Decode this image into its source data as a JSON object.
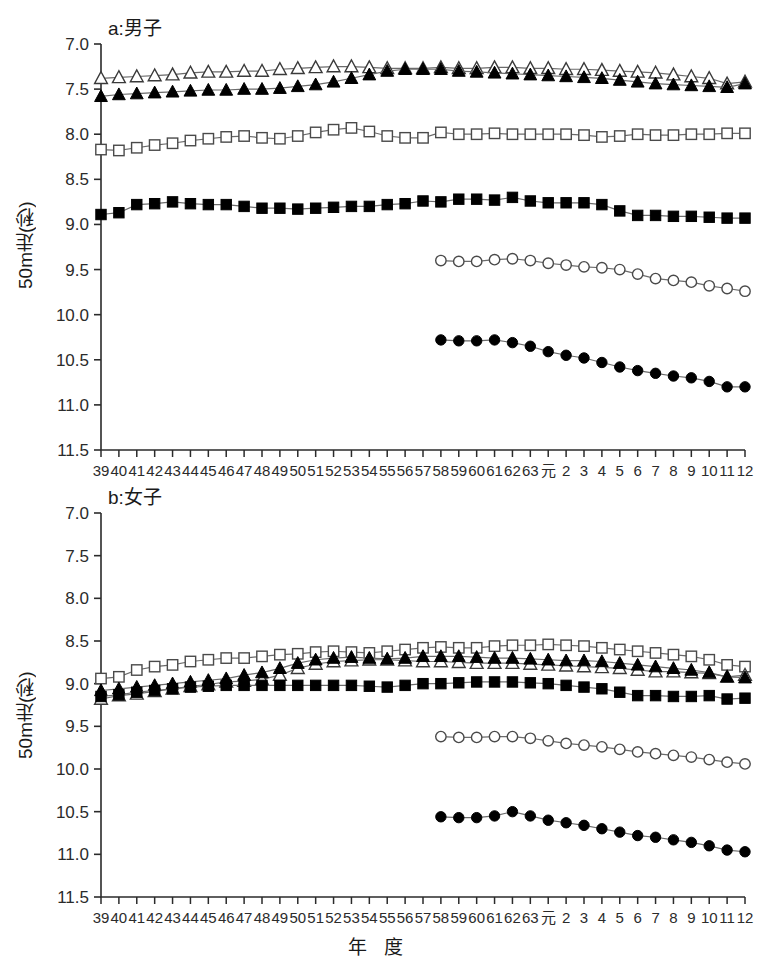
{
  "figure": {
    "width": 768,
    "height": 971,
    "xaxis_title": "年 度",
    "ylabel": "50m走(秒)"
  },
  "chart_data": [
    {
      "type": "line",
      "panel_id": "a",
      "title": "a:男子",
      "xlabel": "年 度",
      "ylabel": "50m走(秒)",
      "ylim": [
        7.0,
        11.5
      ],
      "y_inverted": true,
      "yticks": [
        "7.0",
        "7.5",
        "8.0",
        "8.5",
        "9.0",
        "9.5",
        "10.0",
        "10.5",
        "11.0",
        "11.5"
      ],
      "ytick_values": [
        7.0,
        7.5,
        8.0,
        8.5,
        9.0,
        9.5,
        10.0,
        10.5,
        11.0,
        11.5
      ],
      "grid": false,
      "legend": "none",
      "categories": [
        "39",
        "40",
        "41",
        "42",
        "43",
        "44",
        "45",
        "46",
        "47",
        "48",
        "49",
        "50",
        "51",
        "52",
        "53",
        "54",
        "55",
        "56",
        "57",
        "58",
        "59",
        "60",
        "61",
        "62",
        "63",
        "元",
        "2",
        "3",
        "4",
        "5",
        "6",
        "7",
        "8",
        "9",
        "10",
        "11",
        "12"
      ],
      "series": [
        {
          "name": "open-triangle",
          "marker": "triangle-open",
          "values": [
            7.38,
            7.37,
            7.36,
            7.35,
            7.34,
            7.32,
            7.31,
            7.31,
            7.3,
            7.3,
            7.28,
            7.27,
            7.26,
            7.25,
            7.25,
            7.26,
            7.27,
            7.27,
            7.27,
            7.26,
            7.27,
            7.27,
            7.26,
            7.26,
            7.27,
            7.27,
            7.28,
            7.28,
            7.29,
            7.3,
            7.31,
            7.32,
            7.34,
            7.36,
            7.38,
            7.44,
            7.42
          ]
        },
        {
          "name": "filled-triangle",
          "marker": "triangle-filled",
          "values": [
            7.58,
            7.56,
            7.55,
            7.54,
            7.53,
            7.52,
            7.51,
            7.51,
            7.5,
            7.5,
            7.49,
            7.47,
            7.45,
            7.42,
            7.38,
            7.34,
            7.3,
            7.28,
            7.28,
            7.28,
            7.3,
            7.31,
            7.32,
            7.33,
            7.34,
            7.35,
            7.36,
            7.37,
            7.38,
            7.4,
            7.42,
            7.44,
            7.45,
            7.46,
            7.47,
            7.48,
            7.44
          ]
        },
        {
          "name": "open-square",
          "marker": "square-open",
          "values": [
            8.17,
            8.18,
            8.15,
            8.12,
            8.1,
            8.07,
            8.05,
            8.03,
            8.02,
            8.04,
            8.05,
            8.02,
            7.98,
            7.95,
            7.93,
            7.97,
            8.02,
            8.04,
            8.04,
            7.98,
            8.0,
            8.0,
            7.99,
            8.0,
            8.0,
            8.0,
            8.0,
            8.01,
            8.03,
            8.02,
            8.0,
            8.01,
            8.01,
            8.0,
            8.0,
            7.99,
            7.99
          ]
        },
        {
          "name": "filled-square",
          "marker": "square-filled",
          "values": [
            8.89,
            8.87,
            8.78,
            8.77,
            8.75,
            8.77,
            8.78,
            8.78,
            8.8,
            8.82,
            8.82,
            8.83,
            8.82,
            8.81,
            8.8,
            8.8,
            8.78,
            8.77,
            8.74,
            8.75,
            8.72,
            8.72,
            8.73,
            8.7,
            8.74,
            8.76,
            8.76,
            8.76,
            8.78,
            8.85,
            8.9,
            8.9,
            8.91,
            8.91,
            8.92,
            8.93,
            8.93
          ]
        },
        {
          "name": "open-circle",
          "marker": "circle-open",
          "values": [
            null,
            null,
            null,
            null,
            null,
            null,
            null,
            null,
            null,
            null,
            null,
            null,
            null,
            null,
            null,
            null,
            null,
            null,
            null,
            9.4,
            9.41,
            9.41,
            9.39,
            9.38,
            9.4,
            9.43,
            9.45,
            9.47,
            9.48,
            9.5,
            9.55,
            9.6,
            9.62,
            9.64,
            9.68,
            9.71,
            9.74
          ]
        },
        {
          "name": "filled-circle",
          "marker": "circle-filled",
          "values": [
            null,
            null,
            null,
            null,
            null,
            null,
            null,
            null,
            null,
            null,
            null,
            null,
            null,
            null,
            null,
            null,
            null,
            null,
            null,
            10.28,
            10.29,
            10.29,
            10.28,
            10.31,
            10.35,
            10.41,
            10.45,
            10.48,
            10.53,
            10.58,
            10.62,
            10.65,
            10.68,
            10.7,
            10.74,
            10.8,
            10.8
          ]
        }
      ]
    },
    {
      "type": "line",
      "panel_id": "b",
      "title": "b:女子",
      "xlabel": "年 度",
      "ylabel": "50m走(秒)",
      "ylim": [
        7.0,
        11.5
      ],
      "y_inverted": true,
      "yticks": [
        "7.0",
        "7.5",
        "8.0",
        "8.5",
        "9.0",
        "9.5",
        "10.0",
        "10.5",
        "11.0",
        "11.5"
      ],
      "ytick_values": [
        7.0,
        7.5,
        8.0,
        8.5,
        9.0,
        9.5,
        10.0,
        10.5,
        11.0,
        11.5
      ],
      "grid": false,
      "legend": "none",
      "categories": [
        "39",
        "40",
        "41",
        "42",
        "43",
        "44",
        "45",
        "46",
        "47",
        "48",
        "49",
        "50",
        "51",
        "52",
        "53",
        "54",
        "55",
        "56",
        "57",
        "58",
        "59",
        "60",
        "61",
        "62",
        "63",
        "元",
        "2",
        "3",
        "4",
        "5",
        "6",
        "7",
        "8",
        "9",
        "10",
        "11",
        "12"
      ],
      "series": [
        {
          "name": "open-square",
          "marker": "square-open",
          "values": [
            8.94,
            8.92,
            8.84,
            8.8,
            8.78,
            8.74,
            8.72,
            8.7,
            8.7,
            8.68,
            8.66,
            8.65,
            8.63,
            8.62,
            8.63,
            8.64,
            8.62,
            8.6,
            8.58,
            8.57,
            8.58,
            8.58,
            8.56,
            8.55,
            8.55,
            8.54,
            8.55,
            8.56,
            8.58,
            8.6,
            8.62,
            8.64,
            8.66,
            8.68,
            8.72,
            8.78,
            8.8
          ]
        },
        {
          "name": "open-triangle",
          "marker": "triangle-open",
          "values": [
            9.18,
            9.14,
            9.12,
            9.09,
            9.06,
            9.03,
            9.01,
            8.98,
            8.97,
            8.95,
            8.9,
            8.82,
            8.77,
            8.74,
            8.73,
            8.72,
            8.72,
            8.73,
            8.74,
            8.74,
            8.75,
            8.76,
            8.76,
            8.76,
            8.77,
            8.78,
            8.79,
            8.8,
            8.81,
            8.82,
            8.84,
            8.86,
            8.86,
            8.87,
            8.88,
            8.92,
            8.9
          ]
        },
        {
          "name": "filled-triangle",
          "marker": "triangle-filled",
          "values": [
            9.08,
            9.06,
            9.04,
            9.02,
            9.0,
            8.98,
            8.96,
            8.94,
            8.9,
            8.87,
            8.82,
            8.76,
            8.72,
            8.7,
            8.69,
            8.7,
            8.71,
            8.7,
            8.68,
            8.68,
            8.68,
            8.69,
            8.7,
            8.7,
            8.71,
            8.72,
            8.73,
            8.73,
            8.74,
            8.76,
            8.78,
            8.8,
            8.82,
            8.84,
            8.87,
            8.92,
            8.93
          ]
        },
        {
          "name": "filled-square",
          "marker": "square-filled",
          "values": [
            9.15,
            9.13,
            9.1,
            9.08,
            9.06,
            9.04,
            9.03,
            9.02,
            9.02,
            9.02,
            9.02,
            9.02,
            9.02,
            9.02,
            9.02,
            9.03,
            9.04,
            9.02,
            9.0,
            9.0,
            8.99,
            8.98,
            8.98,
            8.98,
            8.99,
            9.0,
            9.02,
            9.04,
            9.06,
            9.1,
            9.14,
            9.14,
            9.15,
            9.15,
            9.14,
            9.18,
            9.17
          ]
        },
        {
          "name": "open-circle",
          "marker": "circle-open",
          "values": [
            null,
            null,
            null,
            null,
            null,
            null,
            null,
            null,
            null,
            null,
            null,
            null,
            null,
            null,
            null,
            null,
            null,
            null,
            null,
            9.62,
            9.63,
            9.63,
            9.62,
            9.62,
            9.64,
            9.67,
            9.7,
            9.72,
            9.74,
            9.77,
            9.8,
            9.82,
            9.84,
            9.86,
            9.89,
            9.92,
            9.94
          ]
        },
        {
          "name": "filled-circle",
          "marker": "circle-filled",
          "values": [
            null,
            null,
            null,
            null,
            null,
            null,
            null,
            null,
            null,
            null,
            null,
            null,
            null,
            null,
            null,
            null,
            null,
            null,
            null,
            10.56,
            10.57,
            10.57,
            10.55,
            10.5,
            10.55,
            10.6,
            10.63,
            10.66,
            10.7,
            10.74,
            10.78,
            10.8,
            10.83,
            10.86,
            10.9,
            10.95,
            10.97
          ]
        }
      ]
    }
  ],
  "colors": {
    "axis": "#2b2b2b",
    "line": "#6b6b6b",
    "marker_fill": "#000000",
    "marker_open": "#ffffff",
    "text": "#1a1a1a",
    "background": "#ffffff"
  }
}
